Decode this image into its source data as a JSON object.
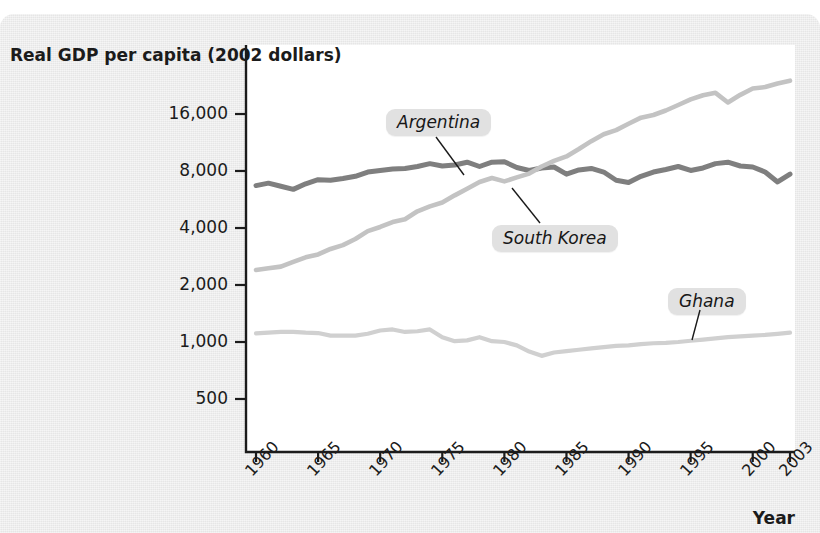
{
  "figure": {
    "y_axis_title": "Real GDP per capita (2002 dollars)",
    "x_axis_title": "Year"
  },
  "chart_data": {
    "type": "line",
    "title": "",
    "subtitle": "",
    "xlabel": "Year",
    "ylabel": "Real GDP per capita (2002 dollars)",
    "yscale": "log",
    "ylim": [
      400,
      20000
    ],
    "xlim": [
      1960,
      2003
    ],
    "grid": false,
    "legend_position": "inline-labels",
    "y_ticks": [
      500,
      1000,
      2000,
      4000,
      8000,
      16000
    ],
    "y_tick_labels": [
      "500",
      "1,000",
      "2,000",
      "4,000",
      "8,000",
      "16,000"
    ],
    "x_ticks": [
      1960,
      1965,
      1970,
      1975,
      1980,
      1985,
      1990,
      1995,
      2000,
      2003
    ],
    "x_tick_labels": [
      "1960",
      "1965",
      "1970",
      "1975",
      "1980",
      "1985",
      "1990",
      "1995",
      "2000",
      "2003"
    ],
    "annotations": [
      {
        "text": "Argentina",
        "series": "Argentina"
      },
      {
        "text": "South Korea",
        "series": "South Korea"
      },
      {
        "text": "Ghana",
        "series": "Ghana"
      }
    ],
    "series": [
      {
        "name": "Argentina",
        "color": "#7f7f7f",
        "x": [
          1960,
          1961,
          1962,
          1963,
          1964,
          1965,
          1966,
          1967,
          1968,
          1969,
          1970,
          1971,
          1972,
          1973,
          1974,
          1975,
          1976,
          1977,
          1978,
          1979,
          1980,
          1981,
          1982,
          1983,
          1984,
          1985,
          1986,
          1987,
          1988,
          1989,
          1990,
          1991,
          1992,
          1993,
          1994,
          1995,
          1996,
          1997,
          1998,
          1999,
          2000,
          2001,
          2002,
          2003
        ],
        "values": [
          6700,
          6900,
          6650,
          6400,
          6850,
          7200,
          7150,
          7300,
          7500,
          7900,
          8050,
          8200,
          8250,
          8450,
          8750,
          8500,
          8600,
          8900,
          8450,
          8900,
          8950,
          8350,
          8050,
          8300,
          8400,
          7700,
          8100,
          8250,
          7900,
          7150,
          6950,
          7500,
          7900,
          8150,
          8450,
          8050,
          8300,
          8750,
          8900,
          8500,
          8400,
          7900,
          7000,
          7700
        ]
      },
      {
        "name": "South Korea",
        "color": "#c3c3c3",
        "x": [
          1960,
          1961,
          1962,
          1963,
          1964,
          1965,
          1966,
          1967,
          1968,
          1969,
          1970,
          1971,
          1972,
          1973,
          1974,
          1975,
          1976,
          1977,
          1978,
          1979,
          1980,
          1981,
          1982,
          1983,
          1984,
          1985,
          1986,
          1987,
          1988,
          1989,
          1990,
          1991,
          1992,
          1993,
          1994,
          1995,
          1996,
          1997,
          1998,
          1999,
          2000,
          2001,
          2002,
          2003
        ],
        "values": [
          2400,
          2450,
          2500,
          2650,
          2800,
          2900,
          3100,
          3250,
          3500,
          3850,
          4050,
          4300,
          4450,
          4900,
          5200,
          5450,
          5950,
          6450,
          7000,
          7350,
          7050,
          7400,
          7750,
          8450,
          9050,
          9550,
          10450,
          11500,
          12500,
          13150,
          14200,
          15300,
          15800,
          16700,
          17850,
          19100,
          20100,
          20700,
          18400,
          20200,
          21800,
          22200,
          23200,
          24000
        ]
      },
      {
        "name": "Ghana",
        "color": "#d0d0d0",
        "x": [
          1960,
          1961,
          1962,
          1963,
          1964,
          1965,
          1966,
          1967,
          1968,
          1969,
          1970,
          1971,
          1972,
          1973,
          1974,
          1975,
          1976,
          1977,
          1978,
          1979,
          1980,
          1981,
          1982,
          1983,
          1984,
          1985,
          1986,
          1987,
          1988,
          1989,
          1990,
          1991,
          1992,
          1993,
          1994,
          1995,
          1996,
          1997,
          1998,
          1999,
          2000,
          2001,
          2002,
          2003
        ],
        "values": [
          1110,
          1120,
          1130,
          1130,
          1120,
          1115,
          1080,
          1080,
          1080,
          1105,
          1150,
          1165,
          1130,
          1140,
          1165,
          1060,
          1010,
          1020,
          1060,
          1010,
          1000,
          960,
          890,
          845,
          880,
          895,
          910,
          925,
          940,
          955,
          960,
          975,
          985,
          990,
          1000,
          1015,
          1030,
          1045,
          1060,
          1070,
          1080,
          1090,
          1105,
          1120
        ]
      }
    ]
  },
  "colors": {
    "panel_background": "#ececec",
    "plot_background": "#ffffff",
    "axis": "#1b1b1b",
    "argentina": "#7f7f7f",
    "south_korea": "#c3c3c3",
    "ghana": "#d0d0d0",
    "label_box": "#e1e1e1"
  }
}
